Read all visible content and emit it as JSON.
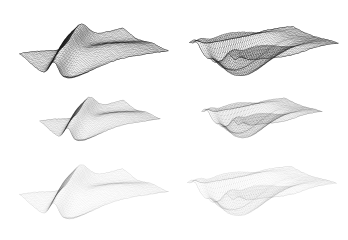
{
  "figure": {
    "title": "",
    "background_color": "#ffffff",
    "width": 348,
    "height": 240,
    "layout": {
      "rows": 3,
      "cols": 2
    }
  },
  "chart_data": {
    "type": "scatter",
    "title": "",
    "subtitle": "",
    "xlabel": "",
    "ylabel": "",
    "legend_position": "none",
    "grid": false,
    "panels": [
      {
        "id": "panel-top-left",
        "name": "folded-sheet-dark",
        "row": 0,
        "col": 0,
        "shape": "folded-sheet",
        "bounds": {
          "x": 18,
          "y": 12,
          "w": 152,
          "h": 78
        },
        "line_color": "#1a1a1a",
        "opacity": 0.92,
        "line_width": 0.35,
        "grid_u": 58,
        "grid_v": 40,
        "yaw": -0.62,
        "pitch": 0.92,
        "scale": 1.0
      },
      {
        "id": "panel-top-right",
        "name": "boat-hull-dark",
        "row": 0,
        "col": 1,
        "shape": "boat-hull",
        "bounds": {
          "x": 188,
          "y": 12,
          "w": 152,
          "h": 78
        },
        "line_color": "#1a1a1a",
        "opacity": 0.92,
        "line_width": 0.35,
        "grid_u": 58,
        "grid_v": 40,
        "yaw": -0.62,
        "pitch": 0.92,
        "scale": 1.0
      },
      {
        "id": "panel-mid-left",
        "name": "folded-sheet-medium",
        "row": 1,
        "col": 0,
        "shape": "folded-sheet",
        "bounds": {
          "x": 30,
          "y": 88,
          "w": 140,
          "h": 62
        },
        "line_color": "#2a2a2a",
        "opacity": 0.42,
        "line_width": 0.3,
        "grid_u": 58,
        "grid_v": 40,
        "yaw": -0.62,
        "pitch": 0.92,
        "scale": 0.88
      },
      {
        "id": "panel-mid-right",
        "name": "boat-hull-medium",
        "row": 1,
        "col": 1,
        "shape": "boat-hull",
        "bounds": {
          "x": 192,
          "y": 86,
          "w": 140,
          "h": 64
        },
        "line_color": "#2a2a2a",
        "opacity": 0.42,
        "line_width": 0.3,
        "grid_u": 58,
        "grid_v": 40,
        "yaw": -0.62,
        "pitch": 0.92,
        "scale": 0.88
      },
      {
        "id": "panel-bot-left",
        "name": "folded-sheet-light",
        "row": 2,
        "col": 0,
        "shape": "folded-sheet",
        "bounds": {
          "x": 18,
          "y": 152,
          "w": 152,
          "h": 80
        },
        "line_color": "#3a3a3a",
        "opacity": 0.2,
        "line_width": 0.3,
        "grid_u": 58,
        "grid_v": 40,
        "yaw": -0.62,
        "pitch": 0.92,
        "scale": 1.0
      },
      {
        "id": "panel-bot-right",
        "name": "boat-hull-light",
        "row": 2,
        "col": 1,
        "shape": "boat-hull",
        "bounds": {
          "x": 186,
          "y": 150,
          "w": 152,
          "h": 82
        },
        "line_color": "#3a3a3a",
        "opacity": 0.2,
        "line_width": 0.3,
        "grid_u": 58,
        "grid_v": 40,
        "yaw": -0.62,
        "pitch": 0.92,
        "scale": 1.0
      }
    ]
  }
}
